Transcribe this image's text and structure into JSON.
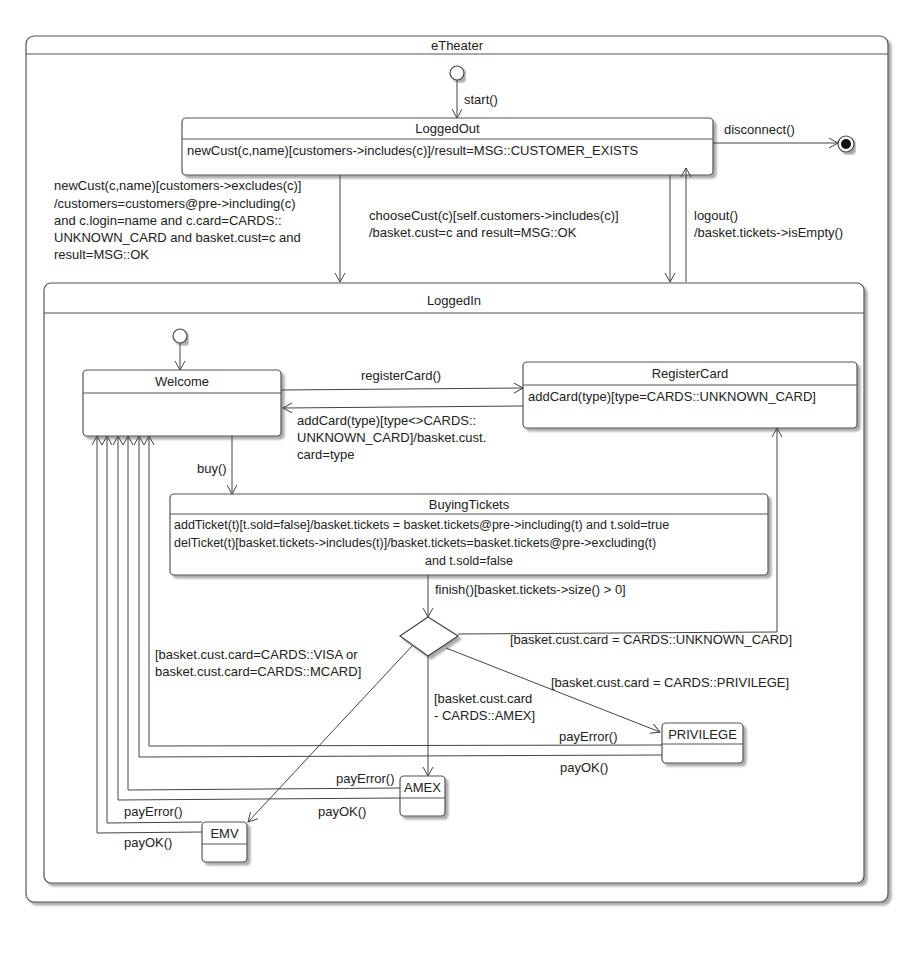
{
  "diagram": {
    "type": "UML state machine",
    "root_state": "eTheater",
    "composite_state": "LoggedIn",
    "states": {
      "logged_out": {
        "name": "LoggedOut",
        "internal": [
          "newCust(c,name)[customers->includes(c)]/result=MSG::CUSTOMER_EXISTS"
        ]
      },
      "logged_in": {
        "name": "LoggedIn"
      },
      "welcome": {
        "name": "Welcome"
      },
      "register_card": {
        "name": "RegisterCard",
        "internal": [
          "addCard(type)[type=CARDS::UNKNOWN_CARD]"
        ]
      },
      "buying_tickets": {
        "name": "BuyingTickets",
        "internal": [
          "addTicket(t)[t.sold=false]/basket.tickets = basket.tickets@pre->including(t) and t.sold=true",
          "delTicket(t)[basket.tickets->includes(t)]/basket.tickets=basket.tickets@pre->excluding(t)",
          "and t.sold=false"
        ]
      },
      "privilege": {
        "name": "PRIVILEGE"
      },
      "amex": {
        "name": "AMEX"
      },
      "emv": {
        "name": "EMV"
      }
    },
    "transitions": {
      "start": "start()",
      "disconnect": "disconnect()",
      "new_cust": [
        "newCust(c,name)[customers->excludes(c)]",
        "/customers=customers@pre->including(c)",
        "and c.login=name and c.card=CARDS::",
        "UNKNOWN_CARD and basket.cust=c and",
        "result=MSG::OK"
      ],
      "choose_cust": [
        "chooseCust(c)[self.customers->includes(c)]",
        "/basket.cust=c and result=MSG::OK"
      ],
      "logout": [
        "logout()",
        "/basket.tickets->isEmpty()"
      ],
      "register_card": "registerCard()",
      "add_card": [
        "addCard(type)[type<>CARDS::",
        "UNKNOWN_CARD]/basket.cust.",
        "card=type"
      ],
      "buy": "buy()",
      "finish": "finish()[basket.tickets->size() > 0]",
      "guard_unknown": "[basket.cust.card = CARDS::UNKNOWN_CARD]",
      "guard_visa_mcard": [
        "[basket.cust.card=CARDS::VISA or",
        "basket.cust.card=CARDS::MCARD]"
      ],
      "guard_amex": [
        "[basket.cust.card",
        "- CARDS::AMEX]"
      ],
      "guard_privilege": "[basket.cust.card = CARDS::PRIVILEGE]",
      "priv_pay_error": "payError()",
      "priv_pay_ok": "payOK()",
      "amex_pay_error": "payError()",
      "amex_pay_ok": "payOK()",
      "emv_pay_error": "payError()",
      "emv_pay_ok": "payOK()"
    }
  }
}
